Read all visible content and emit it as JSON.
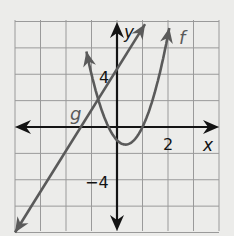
{
  "chart_data": {
    "type": "line",
    "title": "",
    "xlabel": "x",
    "ylabel": "y",
    "xlim": [
      -4,
      4
    ],
    "ylim": [
      -8,
      8
    ],
    "x_grid_step": 1,
    "y_grid_step": 2,
    "grid": true,
    "tick_labels": {
      "x": [
        {
          "value": 2,
          "label": "2"
        }
      ],
      "y": [
        {
          "value": 4,
          "label": "4"
        },
        {
          "value": -4,
          "label": "−4"
        }
      ]
    },
    "series": [
      {
        "name": "f",
        "kind": "parabola",
        "equation_estimate": "f(x) = 3x^2 - 2x - 1",
        "points": [
          [
            -1.2,
            5.72
          ],
          [
            -1,
            4
          ],
          [
            -0.5,
            0.75
          ],
          [
            -0.333,
            0
          ],
          [
            0,
            -1
          ],
          [
            0.333,
            -1.333
          ],
          [
            0.5,
            -1.25
          ],
          [
            1,
            0
          ],
          [
            1.5,
            2.75
          ],
          [
            2,
            7
          ],
          [
            2.05,
            7.5
          ]
        ],
        "color": "#5a5a5a"
      },
      {
        "name": "g",
        "kind": "line",
        "equation_estimate": "g(x) = 3x + 4",
        "points": [
          [
            -4,
            -8
          ],
          [
            -1.333,
            0
          ],
          [
            0,
            4
          ],
          [
            1.1,
            7.8
          ]
        ],
        "color": "#5a5a5a"
      }
    ],
    "labels": {
      "f": "f",
      "g": "g",
      "x_axis": "x",
      "y_axis": "y",
      "x_tick_2": "2",
      "y_tick_4": "4",
      "y_tick_neg4": "−4"
    },
    "colors": {
      "background": "#ececea",
      "grid": "#9a9a9a",
      "axis": "#141414",
      "curve": "#5a5a5a"
    }
  }
}
